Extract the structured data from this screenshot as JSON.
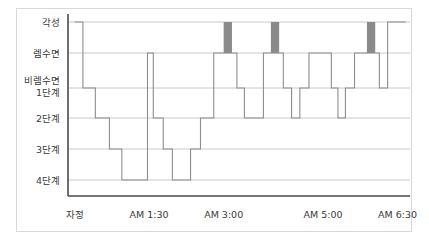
{
  "figure": {
    "kind": "hypnogram",
    "frame_color": "#d8d8d8",
    "axis_color": "#4a4a4a",
    "grid_color": "#bdbdbd",
    "trace_color": "#8e8e8e",
    "highlight_color": "#8a8a8a",
    "background": "#ffffff"
  },
  "chart_data": {
    "type": "line",
    "title": "",
    "xlabel": "",
    "ylabel": "",
    "grid": true,
    "legend": "none",
    "y_categories": [
      "각성",
      "렘수면",
      "비렘수면 1단계",
      "2단계",
      "3단계",
      "4단계"
    ],
    "y_labels_display": [
      {
        "line1": "각성",
        "line2": ""
      },
      {
        "line1": "렘수면",
        "line2": ""
      },
      {
        "line1": "비렘수면",
        "line2": "1단계"
      },
      {
        "line1": "2단계",
        "line2": ""
      },
      {
        "line1": "3단계",
        "line2": ""
      },
      {
        "line1": "4단계",
        "line2": ""
      }
    ],
    "y_levels": {
      "각성": 0,
      "렘수면": 1,
      "비렘수면 1단계": 2,
      "2단계": 3,
      "3단계": 4,
      "4단계": 5
    },
    "x_ticks": [
      "자정",
      "AM 1:30",
      "AM 3:00",
      "AM 5:00",
      "AM 6:30"
    ],
    "x_tick_minutes": [
      0,
      90,
      180,
      300,
      390
    ],
    "xlim_minutes": [
      -8,
      405
    ],
    "ylim_levels": [
      0,
      5
    ],
    "series": [
      {
        "name": "수면 단계",
        "step": "post",
        "points_minutes_level": [
          [
            0,
            0
          ],
          [
            10,
            0
          ],
          [
            10,
            2
          ],
          [
            25,
            2
          ],
          [
            25,
            3
          ],
          [
            42,
            3
          ],
          [
            42,
            4
          ],
          [
            57,
            4
          ],
          [
            57,
            5
          ],
          [
            88,
            5
          ],
          [
            88,
            1
          ],
          [
            95,
            1
          ],
          [
            95,
            3
          ],
          [
            107,
            3
          ],
          [
            107,
            4
          ],
          [
            118,
            4
          ],
          [
            118,
            5
          ],
          [
            140,
            5
          ],
          [
            140,
            4
          ],
          [
            152,
            4
          ],
          [
            152,
            3
          ],
          [
            168,
            3
          ],
          [
            168,
            1
          ],
          [
            196,
            1
          ],
          [
            196,
            2
          ],
          [
            205,
            2
          ],
          [
            205,
            3
          ],
          [
            228,
            3
          ],
          [
            228,
            1
          ],
          [
            252,
            1
          ],
          [
            252,
            2
          ],
          [
            262,
            2
          ],
          [
            262,
            3
          ],
          [
            272,
            3
          ],
          [
            272,
            2
          ],
          [
            283,
            2
          ],
          [
            283,
            1
          ],
          [
            310,
            1
          ],
          [
            310,
            2
          ],
          [
            318,
            2
          ],
          [
            318,
            3
          ],
          [
            327,
            3
          ],
          [
            327,
            2
          ],
          [
            338,
            2
          ],
          [
            338,
            1
          ],
          [
            368,
            1
          ],
          [
            368,
            2
          ],
          [
            378,
            2
          ],
          [
            378,
            0
          ],
          [
            400,
            0
          ]
        ]
      }
    ],
    "highlight_bars": [
      {
        "label": "각성 구간 1",
        "start_minutes": 180,
        "end_minutes": 190,
        "from_level": 1,
        "to_level": 0
      },
      {
        "label": "각성 구간 2",
        "start_minutes": 237,
        "end_minutes": 247,
        "from_level": 1,
        "to_level": 0
      },
      {
        "label": "각성 구간 3",
        "start_minutes": 353,
        "end_minutes": 363,
        "from_level": 1,
        "to_level": 0
      }
    ]
  }
}
